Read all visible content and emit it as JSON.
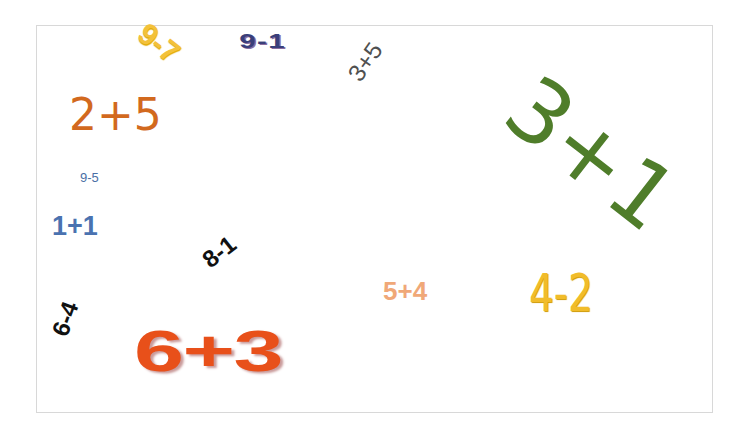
{
  "expressions": [
    {
      "id": "e1",
      "text": "9-7",
      "color": "#f3c13a",
      "rotation_deg": 38
    },
    {
      "id": "e2",
      "text": "9-1",
      "color": "#3a3f7a",
      "rotation_deg": 0
    },
    {
      "id": "e3",
      "text": "3+5",
      "color": "#505050",
      "rotation_deg": -55
    },
    {
      "id": "e4",
      "text": "3+1",
      "color": "#4f7d2a",
      "rotation_deg": 38
    },
    {
      "id": "e5",
      "text": "2+5",
      "color": "#d2691e",
      "rotation_deg": 0
    },
    {
      "id": "e6",
      "text": "9-5",
      "color": "#4a6fa5",
      "rotation_deg": 0
    },
    {
      "id": "e7",
      "text": "1+1",
      "color": "#4a72b0",
      "rotation_deg": 0
    },
    {
      "id": "e8",
      "text": "8-1",
      "color": "#111111",
      "rotation_deg": -38
    },
    {
      "id": "e9",
      "text": "6-4",
      "color": "#111111",
      "rotation_deg": -70
    },
    {
      "id": "e10",
      "text": "6+3",
      "color": "#e8501a",
      "rotation_deg": 0
    },
    {
      "id": "e11",
      "text": "5+4",
      "color": "#f0a878",
      "rotation_deg": 0
    },
    {
      "id": "e12",
      "text": "4-2",
      "color": "#f1bc2a",
      "rotation_deg": 0
    }
  ]
}
